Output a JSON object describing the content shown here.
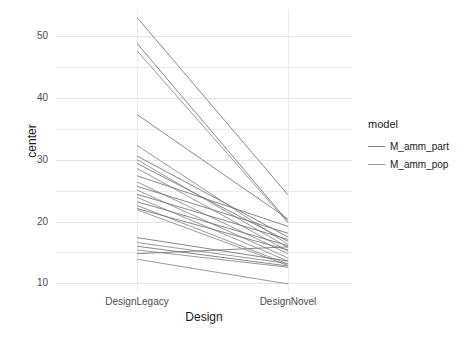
{
  "chart_data": {
    "type": "line",
    "title": "",
    "xlabel": "Design",
    "ylabel": "center",
    "categories": [
      "DesignLegacy",
      "DesignNovel"
    ],
    "xlim": [
      0,
      1
    ],
    "ylim": [
      8.6,
      54.2
    ],
    "yticks": [
      10,
      20,
      30,
      40,
      50
    ],
    "ytick_labels": [
      "10",
      "20",
      "30",
      "40",
      "50"
    ],
    "xticks": [
      0,
      1
    ],
    "xtick_labels": [
      "DesignLegacy",
      "DesignNovel"
    ],
    "grid": true,
    "legend": {
      "title": "model",
      "position": "right",
      "entries": [
        {
          "name": "M_amm_part",
          "color": "#808080"
        },
        {
          "name": "M_amm_pop",
          "color": "#9a9a9a"
        }
      ]
    },
    "series": [
      {
        "name": "M_amm_part",
        "color": "#7a7a7a",
        "points": [
          {
            "x": "DesignLegacy",
            "y": 53.0
          },
          {
            "x": "DesignNovel",
            "y": 24.3
          }
        ]
      },
      {
        "name": "M_amm_part",
        "color": "#7a7a7a",
        "points": [
          {
            "x": "DesignLegacy",
            "y": 48.8
          },
          {
            "x": "DesignNovel",
            "y": 20.0
          }
        ]
      },
      {
        "name": "M_amm_pop",
        "color": "#8f8f8f",
        "points": [
          {
            "x": "DesignLegacy",
            "y": 47.6
          },
          {
            "x": "DesignNovel",
            "y": 19.8
          }
        ]
      },
      {
        "name": "M_amm_part",
        "color": "#7a7a7a",
        "points": [
          {
            "x": "DesignLegacy",
            "y": 37.3
          },
          {
            "x": "DesignNovel",
            "y": 20.4
          }
        ]
      },
      {
        "name": "M_amm_pop",
        "color": "#8f8f8f",
        "points": [
          {
            "x": "DesignLegacy",
            "y": 32.3
          },
          {
            "x": "DesignNovel",
            "y": 16.3
          }
        ]
      },
      {
        "name": "M_amm_part",
        "color": "#7a7a7a",
        "points": [
          {
            "x": "DesignLegacy",
            "y": 30.6
          },
          {
            "x": "DesignNovel",
            "y": 17.5
          }
        ]
      },
      {
        "name": "M_amm_pop",
        "color": "#8f8f8f",
        "points": [
          {
            "x": "DesignLegacy",
            "y": 30.0
          },
          {
            "x": "DesignNovel",
            "y": 15.8
          }
        ]
      },
      {
        "name": "M_amm_part",
        "color": "#7a7a7a",
        "points": [
          {
            "x": "DesignLegacy",
            "y": 29.4
          },
          {
            "x": "DesignNovel",
            "y": 16.8
          }
        ]
      },
      {
        "name": "M_amm_pop",
        "color": "#8f8f8f",
        "points": [
          {
            "x": "DesignLegacy",
            "y": 28.6
          },
          {
            "x": "DesignNovel",
            "y": 15.2
          }
        ]
      },
      {
        "name": "M_amm_part",
        "color": "#7a7a7a",
        "points": [
          {
            "x": "DesignLegacy",
            "y": 27.4
          },
          {
            "x": "DesignNovel",
            "y": 19.2
          }
        ]
      },
      {
        "name": "M_amm_pop",
        "color": "#8f8f8f",
        "points": [
          {
            "x": "DesignLegacy",
            "y": 26.4
          },
          {
            "x": "DesignNovel",
            "y": 14.8
          }
        ]
      },
      {
        "name": "M_amm_part",
        "color": "#7a7a7a",
        "points": [
          {
            "x": "DesignLegacy",
            "y": 25.7
          },
          {
            "x": "DesignNovel",
            "y": 18.1
          }
        ]
      },
      {
        "name": "M_amm_pop",
        "color": "#8f8f8f",
        "points": [
          {
            "x": "DesignLegacy",
            "y": 25.1
          },
          {
            "x": "DesignNovel",
            "y": 14.1
          }
        ]
      },
      {
        "name": "M_amm_part",
        "color": "#7a7a7a",
        "points": [
          {
            "x": "DesignLegacy",
            "y": 24.4
          },
          {
            "x": "DesignNovel",
            "y": 17.1
          }
        ]
      },
      {
        "name": "M_amm_pop",
        "color": "#8f8f8f",
        "points": [
          {
            "x": "DesignLegacy",
            "y": 23.9
          },
          {
            "x": "DesignNovel",
            "y": 13.6
          }
        ]
      },
      {
        "name": "M_amm_part",
        "color": "#7a7a7a",
        "points": [
          {
            "x": "DesignLegacy",
            "y": 23.2
          },
          {
            "x": "DesignNovel",
            "y": 16.1
          }
        ]
      },
      {
        "name": "M_amm_pop",
        "color": "#8f8f8f",
        "points": [
          {
            "x": "DesignLegacy",
            "y": 22.6
          },
          {
            "x": "DesignNovel",
            "y": 13.1
          }
        ]
      },
      {
        "name": "M_amm_part",
        "color": "#7a7a7a",
        "points": [
          {
            "x": "DesignLegacy",
            "y": 22.1
          },
          {
            "x": "DesignNovel",
            "y": 15.4
          }
        ]
      },
      {
        "name": "M_amm_pop",
        "color": "#8f8f8f",
        "points": [
          {
            "x": "DesignLegacy",
            "y": 21.9
          },
          {
            "x": "DesignNovel",
            "y": 12.9
          }
        ]
      },
      {
        "name": "M_amm_part",
        "color": "#7a7a7a",
        "points": [
          {
            "x": "DesignLegacy",
            "y": 17.4
          },
          {
            "x": "DesignNovel",
            "y": 13.6
          }
        ]
      },
      {
        "name": "M_amm_pop",
        "color": "#8f8f8f",
        "points": [
          {
            "x": "DesignLegacy",
            "y": 16.6
          },
          {
            "x": "DesignNovel",
            "y": 13.2
          }
        ]
      },
      {
        "name": "M_amm_part",
        "color": "#7a7a7a",
        "points": [
          {
            "x": "DesignLegacy",
            "y": 16.0
          },
          {
            "x": "DesignNovel",
            "y": 12.8
          }
        ]
      },
      {
        "name": "M_amm_pop",
        "color": "#8f8f8f",
        "points": [
          {
            "x": "DesignLegacy",
            "y": 15.4
          },
          {
            "x": "DesignNovel",
            "y": 12.6
          }
        ]
      },
      {
        "name": "M_amm_part",
        "color": "#7a7a7a",
        "points": [
          {
            "x": "DesignLegacy",
            "y": 14.8
          },
          {
            "x": "DesignNovel",
            "y": 15.9
          }
        ]
      },
      {
        "name": "M_amm_pop",
        "color": "#8f8f8f",
        "points": [
          {
            "x": "DesignLegacy",
            "y": 13.9
          },
          {
            "x": "DesignNovel",
            "y": 9.9
          }
        ]
      }
    ]
  },
  "axes": {
    "y_title": "center",
    "x_title": "Design"
  },
  "legend": {
    "title": "model",
    "items": [
      {
        "label": "M_amm_part"
      },
      {
        "label": "M_amm_pop"
      }
    ]
  },
  "ticks": {
    "y": [
      "50",
      "40",
      "30",
      "20",
      "10"
    ],
    "x": [
      "DesignLegacy",
      "DesignNovel"
    ]
  }
}
